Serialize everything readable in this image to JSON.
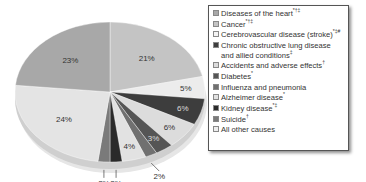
{
  "chart_data": {
    "type": "pie",
    "title": "",
    "categories": [
      "Diseases of the heart",
      "Cancer",
      "Cerebrovascular disease (stroke)",
      "Chronic obstructive lung disease and allied conditions",
      "Accidents and adverse effects",
      "Diabetes",
      "Influenza and pneumonia",
      "Alzheimer disease",
      "Kidney disease",
      "Suicide",
      "All other causes"
    ],
    "values": [
      23,
      21,
      5,
      6,
      6,
      3,
      2,
      4,
      2,
      2,
      24
    ],
    "unit": "%",
    "legend_position": "right",
    "style": "3d-tilted"
  },
  "pie": {
    "slices": [
      {
        "label": "Cancer",
        "pct": 21,
        "text": "21%",
        "color": "#c4c4c4"
      },
      {
        "label": "Cerebrovascular disease (stroke)",
        "pct": 5,
        "text": "5%",
        "color": "#ececec"
      },
      {
        "label": "Chronic obstructive lung disease and allied conditions",
        "pct": 6,
        "text": "6%",
        "color": "#3d3d3d"
      },
      {
        "label": "Accidents and adverse effects",
        "pct": 6,
        "text": "6%",
        "color": "#dcdcdc"
      },
      {
        "label": "Diabetes",
        "pct": 3,
        "text": "3%",
        "color": "#555555"
      },
      {
        "label": "Influenza and pneumonia",
        "pct": 2,
        "text": "2%",
        "color": "#707070"
      },
      {
        "label": "Alzheimer disease",
        "pct": 4,
        "text": "4%",
        "color": "#e2e2e2"
      },
      {
        "label": "Kidney disease",
        "pct": 2,
        "text": "2%",
        "color": "#2a2a2a"
      },
      {
        "label": "Suicide",
        "pct": 2,
        "text": "2%",
        "color": "#7a7a7a"
      },
      {
        "label": "All other causes",
        "pct": 24,
        "text": "24%",
        "color": "#e4e4e4"
      },
      {
        "label": "Diseases of the heart",
        "pct": 23,
        "text": "23%",
        "color": "#a8a8a8"
      }
    ]
  },
  "legend": {
    "items": [
      {
        "label": "Diseases of the heart",
        "marks": "*†‡",
        "color": "#a8a8a8"
      },
      {
        "label": "Cancer",
        "marks": "*†‡",
        "color": "#c4c4c4"
      },
      {
        "label": "Cerebrovascular disease (stroke)",
        "marks": "*‡#",
        "color": "#f4f4f4"
      },
      {
        "label": "Chronic obstructive lung disease and allied conditions",
        "marks": "‡",
        "color": "#3d3d3d"
      },
      {
        "label": "Accidents and adverse effects",
        "marks": "†",
        "color": "#dcdcdc"
      },
      {
        "label": "Diabetes",
        "marks": "*",
        "color": "#555555"
      },
      {
        "label": "Influenza and pneumonia",
        "marks": "",
        "color": "#707070"
      },
      {
        "label": "Alzheimer disease",
        "marks": "*",
        "color": "#e2e2e2"
      },
      {
        "label": "Kidney disease",
        "marks": "*‡",
        "color": "#2a2a2a"
      },
      {
        "label": "Suicide",
        "marks": "†",
        "color": "#7a7a7a"
      },
      {
        "label": "All other causes",
        "marks": "",
        "color": "#eeeeee"
      }
    ]
  }
}
